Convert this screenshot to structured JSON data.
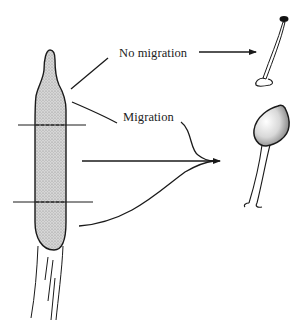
{
  "diagram": {
    "labels": {
      "no_migration": "No migration",
      "migration": "Migration"
    },
    "elements": {
      "source_structure": "elongated stippled body with tapered tip, two horizontal cut lines, and fibrous base",
      "outcome_no_migration": "thin stalk with small dark head and looped foot",
      "outcome_migration": "stalk with large rounded shaded head and split foot"
    },
    "colors": {
      "ink": "#1a1a1a",
      "stipple_fill": "#c8c8c8",
      "background": "#ffffff"
    }
  }
}
